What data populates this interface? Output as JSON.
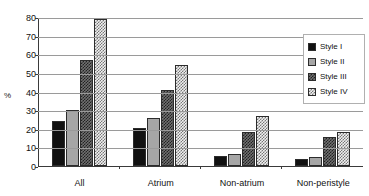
{
  "chart_data": {
    "type": "bar",
    "title": "",
    "xlabel": "",
    "ylabel": "%",
    "ylim": [
      0,
      80
    ],
    "yticks": [
      0,
      10,
      20,
      30,
      40,
      50,
      60,
      70,
      80
    ],
    "grid": true,
    "legend_position": "right",
    "categories": [
      "All",
      "Atrium",
      "Non-atrium",
      "Non-peristyle"
    ],
    "series": [
      {
        "name": "Style I",
        "values": [
          24,
          20.5,
          5.5,
          3.5
        ],
        "color": "#111111"
      },
      {
        "name": "Style II",
        "values": [
          30,
          26,
          6.5,
          5
        ],
        "color": "#a6a6a6"
      },
      {
        "name": "Style III",
        "values": [
          57,
          41,
          18.5,
          15.5
        ],
        "color": "#707070"
      },
      {
        "name": "Style IV",
        "values": [
          79,
          54,
          27,
          18.5
        ],
        "color": "#f0f0f0"
      }
    ]
  },
  "legend": {
    "items": [
      {
        "label": "Style I"
      },
      {
        "label": "Style II"
      },
      {
        "label": "Style III"
      },
      {
        "label": "Style IV"
      }
    ]
  }
}
